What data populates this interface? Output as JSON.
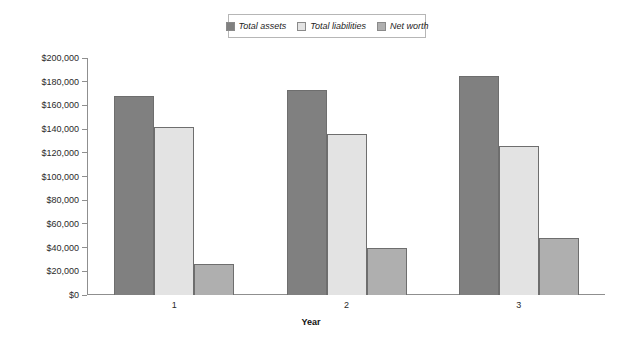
{
  "chart_data": {
    "type": "bar",
    "title": "",
    "xlabel": "Year",
    "ylabel": "",
    "categories": [
      "1",
      "2",
      "3"
    ],
    "series": [
      {
        "name": "Total assets",
        "values": [
          168000,
          173000,
          185000
        ],
        "color": "#808080"
      },
      {
        "name": "Total liabilities",
        "values": [
          142000,
          136000,
          126000
        ],
        "color": "#e3e3e3"
      },
      {
        "name": "Net worth",
        "values": [
          26000,
          40000,
          48000
        ],
        "color": "#afafaf"
      }
    ],
    "ylim": [
      0,
      200000
    ],
    "ytick_values": [
      200000,
      180000,
      160000,
      140000,
      120000,
      100000,
      80000,
      60000,
      40000,
      20000,
      0
    ],
    "ytick_labels": [
      "$200,000",
      "$180,000",
      "$160,000",
      "$140,000",
      "$120,000",
      "$100,000",
      "$80,000",
      "$60,000",
      "$40,000",
      "$20,000",
      "$0"
    ],
    "grid": false,
    "legend_position": "top-center",
    "bar_border_color": "#6e6e6e",
    "axis_color": "#8f8f8f",
    "background": "#ffffff"
  }
}
